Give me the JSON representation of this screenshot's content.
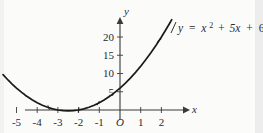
{
  "figure": {
    "title": "",
    "equation_label": {
      "lhs": "y",
      "equals": "=",
      "term1_base": "x",
      "term1_exp": "2",
      "plus1": "+",
      "term2": "5x",
      "plus2": "+",
      "term3": "6",
      "full_text": "y = x2 + 5x + 6"
    },
    "axis_names": {
      "x": "x",
      "y": "y"
    },
    "origin_label": "O",
    "colors": {
      "background": "#fbfbfa",
      "curve": "#1a1a1a",
      "axis": "#3a3a3a",
      "text": "#2b2b2b",
      "edge_band": "#ededed"
    }
  },
  "chart_data": {
    "type": "line",
    "title": "",
    "subtitle": "",
    "xlabel": "x",
    "ylabel": "y",
    "equation": "y = x^2 + 5x + 6",
    "xlim": [
      -5.8,
      2.9
    ],
    "ylim": [
      -2.5,
      25
    ],
    "xticks": [
      -5,
      -4,
      -3,
      -2,
      -1,
      0,
      1,
      2
    ],
    "xticklabels": [
      "-5",
      "-4",
      "-3",
      "-2",
      "-1",
      "O",
      "1",
      "2"
    ],
    "yticks": [
      5,
      10,
      15,
      20
    ],
    "yticklabels": [
      "5",
      "10",
      "15",
      "20"
    ],
    "grid": false,
    "legend": false,
    "annotations": [
      {
        "text": "y = x2 + 5x + 6",
        "x": 1.95,
        "y": 23.2
      }
    ],
    "series": [
      {
        "name": "y = x^2 + 5x + 6",
        "x": [
          -5.65,
          -5.4,
          -5.2,
          -5.0,
          -4.75,
          -4.5,
          -4.25,
          -4.0,
          -3.75,
          -3.5,
          -3.25,
          -3.0,
          -2.75,
          -2.5,
          -2.25,
          -2.0,
          -1.75,
          -1.5,
          -1.25,
          -1.0,
          -0.75,
          -0.5,
          -0.25,
          0.0,
          0.25,
          0.5,
          0.75,
          1.0,
          1.25,
          1.5,
          1.75,
          2.0,
          2.2,
          2.4,
          2.5
        ],
        "y": [
          9.67,
          8.16,
          7.04,
          6.0,
          4.81,
          3.75,
          2.81,
          2.0,
          1.31,
          0.75,
          0.31,
          0.0,
          -0.19,
          -0.25,
          -0.19,
          0.0,
          0.31,
          0.75,
          1.31,
          2.0,
          2.81,
          3.75,
          4.81,
          6.0,
          7.31,
          8.75,
          10.31,
          12.0,
          13.81,
          15.75,
          17.81,
          20.0,
          21.84,
          23.76,
          24.75
        ]
      }
    ],
    "roots": [
      -3,
      -2
    ],
    "vertex": [
      -2.5,
      -0.25
    ],
    "y_intercept": 6,
    "curve_tick_marks": [
      {
        "x": -4.6,
        "y": 4.16
      },
      {
        "x": -3.45,
        "y": 0.6975
      },
      {
        "x": -2.0,
        "y": 0.0
      },
      {
        "x": -1.05,
        "y": 1.8975
      },
      {
        "x": 0.0,
        "y": 6.0
      },
      {
        "x": 1.0,
        "y": 12.0
      },
      {
        "x": 1.9,
        "y": 19.11
      }
    ]
  }
}
